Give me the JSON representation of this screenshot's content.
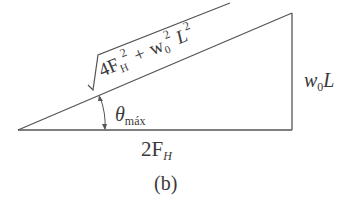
{
  "diagram": {
    "caption": "(b)",
    "hypotenuse_label": {
      "term1_coef": "4F",
      "term1_sub": "H",
      "term1_exp": "2",
      "plus": "+",
      "term2_base": "w",
      "term2_sub": "0",
      "term2_exp": "2",
      "term3_base": "L",
      "term3_exp": "2"
    },
    "vertical_label": {
      "base": "w",
      "sub": "0",
      "tail": "L"
    },
    "horizontal_label": {
      "coef": "2F",
      "sub": "H"
    },
    "angle_label": {
      "symbol": "θ",
      "sub": "máx"
    },
    "colors": {
      "line": "#555555",
      "text": "#3a3a3a"
    }
  }
}
